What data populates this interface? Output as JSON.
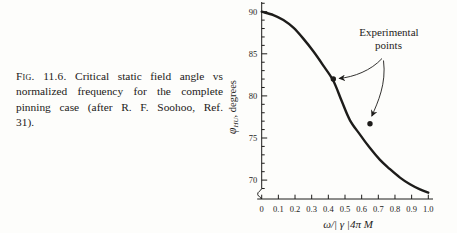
{
  "colors": {
    "ink": "#1d1c1a",
    "background": "#fdfdfb"
  },
  "caption": {
    "label": "Fig. 11.6.",
    "line1_rest": "Critical static field angle vs",
    "line2": "normalized frequency for the complete",
    "line3": "pinning case (after R. F. Soohoo, Ref.",
    "line4": "31)."
  },
  "chart": {
    "annotation_line1": "Experimental",
    "annotation_line2": "points",
    "ylabel_sym": "φ",
    "ylabel_sub": "HU",
    "ylabel_rest": ", degrees",
    "x_tick_labels": [
      "0",
      "0.1",
      "0.2",
      "0.3",
      "0.4",
      "0.5",
      "0.6",
      "0.7",
      "0.8",
      "0.9",
      "1.0"
    ],
    "y_tick_labels": [
      "70",
      "75",
      "80",
      "85",
      "90"
    ]
  },
  "chart_data": {
    "type": "line",
    "title": "",
    "xlabel": "ω/| γ |4π M",
    "ylabel": "φHU, degrees",
    "xlim": [
      0,
      1.0
    ],
    "ylim": [
      68,
      91
    ],
    "x_ticks": [
      0,
      0.1,
      0.2,
      0.3,
      0.4,
      0.5,
      0.6,
      0.7,
      0.8,
      0.9,
      1.0
    ],
    "y_ticks": [
      70,
      75,
      80,
      85,
      90
    ],
    "y_minor_tick_step": 1,
    "y_axis_break_at_bottom": true,
    "grid": false,
    "series": [
      {
        "name": "critical-angle-theory-curve",
        "type": "line",
        "x": [
          0,
          0.07,
          0.13,
          0.19,
          0.25,
          0.31,
          0.37,
          0.43,
          0.48,
          0.53,
          0.59,
          0.65,
          0.71,
          0.77,
          0.83,
          0.89,
          0.95,
          1.0
        ],
        "y": [
          90.0,
          89.6,
          89.0,
          88.1,
          86.8,
          85.3,
          83.6,
          81.8,
          79.4,
          77.1,
          75.4,
          73.8,
          72.4,
          71.3,
          70.3,
          69.5,
          68.9,
          68.5
        ]
      },
      {
        "name": "experimental-points",
        "type": "scatter",
        "x": [
          0.43,
          0.65
        ],
        "y": [
          82.0,
          76.7
        ]
      }
    ],
    "annotation": {
      "text": "Experimental points",
      "arrow_targets": [
        [
          0.43,
          82.0
        ],
        [
          0.65,
          76.7
        ]
      ]
    }
  }
}
